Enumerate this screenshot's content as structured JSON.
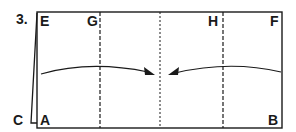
{
  "step": {
    "number": "3."
  },
  "labels": {
    "E": "E",
    "G": "G",
    "H": "H",
    "F": "F",
    "C": "C",
    "A": "A",
    "B": "B"
  },
  "colors": {
    "line": "#1a1a1a",
    "background": "#ffffff"
  }
}
